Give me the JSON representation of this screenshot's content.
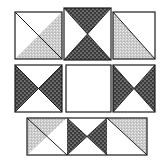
{
  "figure": {
    "name": "quilt-block-layout-diagram",
    "canvas": {
      "width": 163,
      "height": 162
    },
    "background_color": "#ffffff",
    "outline_color": "#1c1c1c",
    "fills": {
      "white": "#ffffff",
      "light_stipple": "#c8c8c8",
      "dark_stipple": "#3a3a3a",
      "stipple_dot_light": "#efefef",
      "stipple_dot_dark": "#ffffff"
    },
    "rows": [
      {
        "name": "top-row",
        "blocks": [
          {
            "name": "block-half-square-triangle-left",
            "position": "top-left",
            "pattern": "half-square-triangle",
            "x": 15,
            "y": 12,
            "width": 47,
            "height": 47,
            "triangles": [
              {
                "name": "upper-left-triangle",
                "fill": "white"
              },
              {
                "name": "lower-right-triangle",
                "fill": "light_stipple"
              }
            ]
          },
          {
            "name": "block-hourglass-top-center",
            "position": "top-center",
            "pattern": "hourglass-vertical",
            "x": 64,
            "y": 8,
            "width": 47,
            "height": 52,
            "triangles": [
              {
                "name": "top-triangle",
                "fill": "dark_stipple"
              },
              {
                "name": "bottom-triangle",
                "fill": "dark_stipple"
              },
              {
                "name": "left-triangle",
                "fill": "white"
              },
              {
                "name": "right-triangle",
                "fill": "white"
              }
            ]
          },
          {
            "name": "block-half-square-triangle-right",
            "position": "top-right",
            "pattern": "half-square-triangle-mirrored",
            "x": 113,
            "y": 12,
            "width": 42,
            "height": 47,
            "triangles": [
              {
                "name": "lower-left-triangle",
                "fill": "light_stipple"
              },
              {
                "name": "upper-right-triangle",
                "fill": "white"
              }
            ]
          }
        ]
      },
      {
        "name": "middle-row",
        "blocks": [
          {
            "name": "block-bowtie-middle-left",
            "position": "middle-left",
            "pattern": "bowtie-horizontal",
            "x": 15,
            "y": 65,
            "width": 47,
            "height": 47,
            "triangles": [
              {
                "name": "left-triangle",
                "fill": "dark_stipple"
              },
              {
                "name": "right-triangle",
                "fill": "dark_stipple"
              },
              {
                "name": "top-triangle",
                "fill": "white"
              },
              {
                "name": "bottom-triangle",
                "fill": "white"
              }
            ]
          },
          {
            "name": "block-plain-center",
            "position": "middle-center",
            "pattern": "plain-square",
            "x": 66,
            "y": 65,
            "width": 45,
            "height": 47,
            "triangles": [
              {
                "name": "solid-fill",
                "fill": "white"
              }
            ]
          },
          {
            "name": "block-bowtie-middle-right",
            "position": "middle-right",
            "pattern": "bowtie-horizontal",
            "x": 113,
            "y": 65,
            "width": 42,
            "height": 47,
            "triangles": [
              {
                "name": "left-triangle",
                "fill": "dark_stipple"
              },
              {
                "name": "right-triangle",
                "fill": "dark_stipple"
              },
              {
                "name": "top-triangle",
                "fill": "white"
              },
              {
                "name": "bottom-triangle",
                "fill": "white"
              }
            ]
          }
        ]
      },
      {
        "name": "bottom-row",
        "blocks": [
          {
            "name": "block-bottom-strip",
            "position": "bottom-wide",
            "pattern": "three-unit-strip",
            "x": 27,
            "y": 118,
            "width": 120,
            "height": 37,
            "units": [
              {
                "name": "bottom-unit-left",
                "pattern": "half-square-triangle-top-right",
                "triangles": [
                  {
                    "name": "upper-left-triangle",
                    "fill": "light_stipple"
                  },
                  {
                    "name": "lower-right-triangle",
                    "fill": "white"
                  }
                ]
              },
              {
                "name": "bottom-unit-center",
                "pattern": "bowtie-horizontal",
                "triangles": [
                  {
                    "name": "left-triangle",
                    "fill": "dark_stipple"
                  },
                  {
                    "name": "right-triangle",
                    "fill": "dark_stipple"
                  },
                  {
                    "name": "top-triangle",
                    "fill": "white"
                  },
                  {
                    "name": "bottom-triangle",
                    "fill": "white"
                  }
                ]
              },
              {
                "name": "bottom-unit-right",
                "pattern": "half-square-triangle-top-left",
                "triangles": [
                  {
                    "name": "upper-right-triangle",
                    "fill": "light_stipple"
                  },
                  {
                    "name": "lower-left-triangle",
                    "fill": "white"
                  }
                ]
              }
            ]
          }
        ]
      }
    ]
  }
}
